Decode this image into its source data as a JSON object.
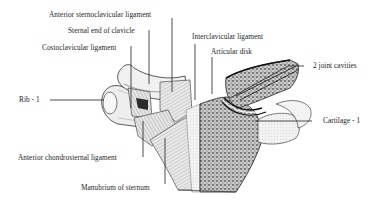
{
  "diagram": {
    "labels": {
      "anterior_sternoclavicular_ligament": "Anterior sternoclavicular ligament",
      "sternal_end_of_clavicle": "Sternal end of clavicle",
      "costoclavicular_ligament": "Costoclavicular ligament",
      "interclavicular_ligament": "Interclavicular ligament",
      "articular_disk": "Articular disk",
      "joint_cavities": "2 joint cavities",
      "rib_1": "Rib - 1",
      "cartilage_1": "Cartilage - 1",
      "anterior_chondrosternal_ligament": "Anterior chondrosternal ligament",
      "manubrium_of_sternum": "Manubrium of sternum"
    },
    "colors": {
      "background": "#ffffff",
      "ink": "#1e1e1e",
      "bone_fill": "#efefef",
      "spongy_bone": "#8a8a8a"
    }
  }
}
